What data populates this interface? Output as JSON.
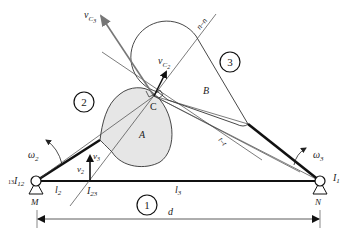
{
  "diagram": {
    "type": "cam-mechanism-instant-centers",
    "labels": {
      "vC3": "v",
      "vC3_sub": "C",
      "vC3_subsub": "3",
      "vC2": "v",
      "vC2_sub": "C",
      "vC2_subsub": "2",
      "normal": "n–n",
      "tangent": "t–t",
      "contact": "C",
      "cam_A": "A",
      "cam_B": "B",
      "link1": "1",
      "link2": "2",
      "link3": "3",
      "omega2": "ω",
      "omega2_sub": "2",
      "omega3": "ω",
      "omega3_sub": "3",
      "v2": "v",
      "v2_sub": "2",
      "v3": "v",
      "v3_sub": "3",
      "I12_prefix": "13",
      "I12": "I",
      "I12_sub": "12",
      "I13": "I",
      "I13_sub": "1",
      "I23": "I",
      "I23_sub": "23",
      "l2": "l",
      "l2_sub": "2",
      "l3": "l",
      "l3_sub": "3",
      "pivot_M": "M",
      "pivot_N": "N",
      "distance": "d"
    },
    "colors": {
      "line": "#222222",
      "thin_line": "#444444",
      "cam_fill": "#e6e6e6",
      "velocity_gray": "#777777"
    }
  }
}
